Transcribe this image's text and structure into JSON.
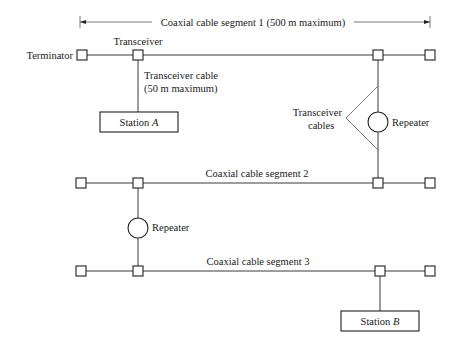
{
  "dimension": {
    "label": "Coaxial cable segment 1 (500 m maximum)"
  },
  "labels": {
    "terminator": "Terminator",
    "transceiver": "Transceiver",
    "transceiver_cable_line1": "Transceiver cable",
    "transceiver_cable_line2": "(50 m maximum)",
    "transceiver_cables_line1": "Transceiver",
    "transceiver_cables_line2": "cables",
    "repeater_1": "Repeater",
    "repeater_2": "Repeater",
    "segment_2": "Coaxial cable segment 2",
    "segment_3": "Coaxial cable segment 3"
  },
  "stations": {
    "a": {
      "prefix": "Station ",
      "name": "A"
    },
    "b": {
      "prefix": "Station ",
      "name": "B"
    }
  }
}
